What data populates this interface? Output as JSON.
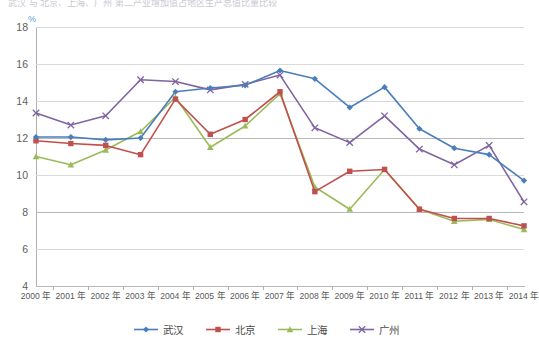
{
  "title_cut": "武汉 与 北京、上海、广州 第二产业增加值占地区生产总值比重比较",
  "axis": {
    "y_unit": "%",
    "y_ticks": [
      "18",
      "16",
      "14",
      "12",
      "10",
      "8",
      "6",
      "4"
    ],
    "y_min": 4,
    "y_max": 18,
    "y_step": 2
  },
  "legend": {
    "items": [
      {
        "label": "武汉",
        "color": "#4a7ebb",
        "marker": "diamond"
      },
      {
        "label": "北京",
        "color": "#c0504d",
        "marker": "square"
      },
      {
        "label": "上海",
        "color": "#9bbb59",
        "marker": "triangle"
      },
      {
        "label": "广州",
        "color": "#8064a2",
        "marker": "cross"
      }
    ]
  },
  "chart_data": {
    "type": "line",
    "title": "武汉 与 北京、上海、广州 第二产业增加值占地区生产总值比重比较",
    "xlabel": "",
    "ylabel": "%",
    "ylim": [
      4,
      18
    ],
    "ystep": 2,
    "grid": true,
    "legend_position": "bottom",
    "categories": [
      "2000 年",
      "2001 年",
      "2002 年",
      "2003 年",
      "2004 年",
      "2005 年",
      "2006 年",
      "2007 年",
      "2008 年",
      "2009 年",
      "2010 年",
      "2011 年",
      "2012 年",
      "2013 年",
      "2014 年"
    ],
    "series": [
      {
        "name": "武汉",
        "color": "#4a7ebb",
        "marker": "diamond",
        "values": [
          12.05,
          12.05,
          11.9,
          12.0,
          14.5,
          14.7,
          14.85,
          15.65,
          15.2,
          13.65,
          14.75,
          12.5,
          11.45,
          11.1,
          9.7
        ]
      },
      {
        "name": "北京",
        "color": "#c0504d",
        "marker": "square",
        "values": [
          11.85,
          11.7,
          11.6,
          11.1,
          14.1,
          12.2,
          13.0,
          14.5,
          9.1,
          10.2,
          10.3,
          8.15,
          7.65,
          7.65,
          7.25
        ]
      },
      {
        "name": "上海",
        "color": "#9bbb59",
        "marker": "triangle",
        "values": [
          11.0,
          10.55,
          11.35,
          12.35,
          14.2,
          11.5,
          12.65,
          14.4,
          9.35,
          8.15,
          10.3,
          8.15,
          7.5,
          7.6,
          7.05
        ]
      },
      {
        "name": "广州",
        "color": "#8064a2",
        "marker": "cross",
        "values": [
          13.35,
          12.7,
          13.2,
          15.15,
          15.05,
          14.6,
          14.9,
          15.4,
          12.55,
          11.75,
          13.2,
          11.4,
          10.55,
          11.6,
          8.55
        ]
      }
    ]
  }
}
